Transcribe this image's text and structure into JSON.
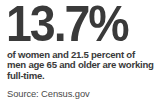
{
  "card": {
    "background_color": "#ffffff",
    "text_color": "#3a3a3a",
    "source_text_color": "#4a4a4a"
  },
  "headline": {
    "value": "13.7",
    "unit": "%",
    "full_text": "13.7%"
  },
  "description": {
    "full_text": "of women and 21.5 percent of men age 65 and older are working full-time.",
    "lines": [
      "of women and 21.5 percent of",
      "men age 65 and older are working",
      "full-time."
    ]
  },
  "source": {
    "label": "Source:",
    "name": "Census.gov",
    "full_text": "Source: Census.gov"
  },
  "chart_data": {
    "type": "table",
    "categories": [
      "Women age 65 and older",
      "Men age 65 and older"
    ],
    "values": [
      13.7,
      21.5
    ],
    "unit": "percent",
    "ylabel": "Percent working full-time",
    "xlabel": "",
    "ylim": [
      0,
      100
    ],
    "annotations": [
      "of women and 21.5 percent of men age 65 and older are working full-time."
    ],
    "source": "Census.gov"
  }
}
